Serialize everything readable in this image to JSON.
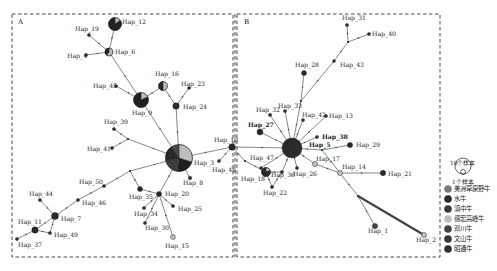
{
  "colors": {
    "american_bison": "#7a7a7a",
    "water_buffalo": "#2a2a2a",
    "dianzhong": "#3a3a3a",
    "dehong_humped": "#bdbdbd",
    "dengchuan": "#444444",
    "wenshan": "#353535",
    "zhaotong": "#303030",
    "edge": "#555555",
    "border": "#333333"
  },
  "panels": {
    "A": {
      "letter": "A"
    },
    "B": {
      "letter": "B"
    }
  },
  "legend": {
    "size_large": "10个样本",
    "size_small": "1个样本",
    "items": [
      {
        "label": "美洲草原野牛",
        "color": "#7a7a7a"
      },
      {
        "label": "水牛",
        "color": "#2a2a2a"
      },
      {
        "label": "滇中牛",
        "color": "#3a3a3a"
      },
      {
        "label": "德宏高峰牛",
        "color": "#bdbdbd"
      },
      {
        "label": "邓川牛",
        "color": "#444444"
      },
      {
        "label": "文山牛",
        "color": "#353535"
      },
      {
        "label": "昭通牛",
        "color": "#303030"
      }
    ]
  },
  "nodes": [
    {
      "id": "Hap_12",
      "label": "Hap_12",
      "x": 115,
      "y": 24,
      "r": 6.5,
      "fill": "#2b2b2b",
      "lx": 122,
      "ly": 24
    },
    {
      "id": "Hap_19",
      "label": "Hap_19",
      "x": 89,
      "y": 35,
      "r": 1.6,
      "fill": "#333",
      "lx": 75,
      "ly": 31
    },
    {
      "id": "Hap_6",
      "label": "Hap_6",
      "x": 109,
      "y": 52,
      "r": 4,
      "fill": "#bdbdbd",
      "lx": 115,
      "ly": 54
    },
    {
      "id": "Hap_4",
      "label": "Hap_4",
      "x": 86,
      "y": 55,
      "r": 1.6,
      "fill": "#333",
      "lx": 67,
      "ly": 58
    },
    {
      "id": "Hap_16",
      "label": "Hap_16",
      "x": 163,
      "y": 86,
      "r": 4.5,
      "fill": "#bdbdbd",
      "lx": 155,
      "ly": 76
    },
    {
      "id": "Hap_23",
      "label": "Hap_23",
      "x": 189,
      "y": 88,
      "r": 1.5,
      "fill": "#333",
      "lx": 181,
      "ly": 86
    },
    {
      "id": "Hap_45",
      "label": "Hap_45",
      "x": 116,
      "y": 86,
      "r": 1.6,
      "fill": "#333",
      "lx": 93,
      "ly": 88
    },
    {
      "id": "Hap_9",
      "label": "Hap_9",
      "x": 141,
      "y": 100,
      "r": 7.5,
      "fill": "#2a2a2a",
      "lx": 132,
      "ly": 115
    },
    {
      "id": "Hap_24",
      "label": "Hap_24",
      "x": 176,
      "y": 106,
      "r": 3.2,
      "fill": "#2a2a2a",
      "lx": 183,
      "ly": 109
    },
    {
      "id": "Hap_39",
      "label": "Hap_39",
      "x": 114,
      "y": 129,
      "r": 1.6,
      "fill": "#333",
      "lx": 104,
      "ly": 124
    },
    {
      "id": "Hap_41",
      "label": "Hap_41",
      "x": 112,
      "y": 148,
      "r": 1.6,
      "fill": "#333",
      "lx": 87,
      "ly": 151
    },
    {
      "id": "Hap_3",
      "label": "Hap_3",
      "x": 179,
      "y": 158,
      "r": 13.5,
      "fill": "#2a2a2a",
      "lx": 194,
      "ly": 165
    },
    {
      "id": "Hap_10",
      "label": "Hap_10",
      "x": 232,
      "y": 147,
      "r": 3.2,
      "fill": "#2a2a2a",
      "lx": 214,
      "ly": 142
    },
    {
      "id": "Hap_48",
      "label": "Hap_48",
      "x": 219,
      "y": 161,
      "r": 1.6,
      "fill": "#333",
      "lx": 212,
      "ly": 172
    },
    {
      "id": "Hap_8",
      "label": "Hap_8",
      "x": 190,
      "y": 178,
      "r": 1.8,
      "fill": "#333",
      "lx": 183,
      "ly": 185
    },
    {
      "id": "Hap_50",
      "label": "Hap_50",
      "x": 104,
      "y": 186,
      "r": 1.6,
      "fill": "#333",
      "lx": 79,
      "ly": 184
    },
    {
      "id": "Hap_35",
      "label": "Hap_35",
      "x": 140,
      "y": 189,
      "r": 2.5,
      "fill": "#2a2a2a",
      "lx": 129,
      "ly": 199
    },
    {
      "id": "Hap_20",
      "label": "Hap_20",
      "x": 159,
      "y": 194,
      "r": 2.5,
      "fill": "#2a2a2a",
      "lx": 165,
      "ly": 196
    },
    {
      "id": "Hap_44",
      "label": "Hap_44",
      "x": 40,
      "y": 200,
      "r": 1.6,
      "fill": "#333",
      "lx": 29,
      "ly": 196
    },
    {
      "id": "Hap_46",
      "label": "Hap_46",
      "x": 78,
      "y": 200,
      "r": 1.6,
      "fill": "#333",
      "lx": 82,
      "ly": 205
    },
    {
      "id": "Hap_34",
      "label": "Hap_34",
      "x": 144,
      "y": 208,
      "r": 1.6,
      "fill": "#333",
      "lx": 134,
      "ly": 216
    },
    {
      "id": "Hap_25",
      "label": "Hap_25",
      "x": 173,
      "y": 206,
      "r": 1.6,
      "fill": "#333",
      "lx": 178,
      "ly": 211
    },
    {
      "id": "Hap_7",
      "label": "Hap_7",
      "x": 55,
      "y": 216,
      "r": 3.5,
      "fill": "#2a2a2a",
      "lx": 61,
      "ly": 221
    },
    {
      "id": "Hap_30",
      "label": "Hap_30",
      "x": 145,
      "y": 223,
      "r": 1.6,
      "fill": "#333",
      "lx": 145,
      "ly": 230
    },
    {
      "id": "Hap_11",
      "label": "Hap_11",
      "x": 35,
      "y": 230,
      "r": 3.2,
      "fill": "#2a2a2a",
      "lx": 18,
      "ly": 224
    },
    {
      "id": "Hap_49",
      "label": "Hap_49",
      "x": 50,
      "y": 233,
      "r": 1.6,
      "fill": "#333",
      "lx": 54,
      "ly": 237
    },
    {
      "id": "Hap_37",
      "label": "Hap_37",
      "x": 17,
      "y": 239,
      "r": 1.6,
      "fill": "#333",
      "lx": 18,
      "ly": 247
    },
    {
      "id": "Hap_15",
      "label": "Hap_15",
      "x": 173,
      "y": 237,
      "r": 2.5,
      "fill": "#bdbdbd",
      "lx": 165,
      "ly": 248
    },
    {
      "id": "Hap_31",
      "label": "Hap_31",
      "x": 347,
      "y": 25,
      "r": 1.6,
      "fill": "#333",
      "lx": 342,
      "ly": 20
    },
    {
      "id": "Hap_40",
      "label": "Hap_40",
      "x": 369,
      "y": 34,
      "r": 1.6,
      "fill": "#333",
      "lx": 372,
      "ly": 36
    },
    {
      "id": "Hap_43",
      "label": "Hap_43",
      "x": 334,
      "y": 61,
      "r": 1.5,
      "fill": "#333",
      "lx": 340,
      "ly": 67
    },
    {
      "id": "Hap_28",
      "label": "Hap_28",
      "x": 304,
      "y": 73,
      "r": 2.5,
      "fill": "#2a2a2a",
      "lx": 295,
      "ly": 67
    },
    {
      "id": "Hap_32",
      "label": "Hap_32",
      "x": 270,
      "y": 115,
      "r": 1.6,
      "fill": "#333",
      "lx": 256,
      "ly": 112
    },
    {
      "id": "Hap_33",
      "label": "Hap_33",
      "x": 285,
      "y": 111,
      "r": 1.6,
      "fill": "#333",
      "lx": 278,
      "ly": 108
    },
    {
      "id": "Hap_42",
      "label": "Hap_42",
      "x": 303,
      "y": 120,
      "r": 1.6,
      "fill": "#333",
      "lx": 302,
      "ly": 117
    },
    {
      "id": "Hap_13",
      "label": "Hap_13",
      "x": 326,
      "y": 116,
      "r": 1.6,
      "fill": "#333",
      "lx": 329,
      "ly": 118
    },
    {
      "id": "Hap_27",
      "label": "Hap_27",
      "x": 260,
      "y": 132,
      "r": 3,
      "fill": "#2a2a2a",
      "lx": 248,
      "ly": 127,
      "bold": true
    },
    {
      "id": "Hap_38",
      "label": "Hap_38",
      "x": 317,
      "y": 137,
      "r": 1.6,
      "fill": "#333",
      "lx": 322,
      "ly": 139,
      "bold": true
    },
    {
      "id": "Hap_5",
      "label": "Hap_5",
      "x": 292,
      "y": 148,
      "r": 10,
      "fill": "#2a2a2a",
      "lx": 309,
      "ly": 147,
      "bold": true
    },
    {
      "id": "Hap_29",
      "label": "Hap_29",
      "x": 350,
      "y": 145,
      "r": 2.6,
      "fill": "#2a2a2a",
      "lx": 356,
      "ly": 147
    },
    {
      "id": "Hap_17",
      "label": "Hap_17",
      "x": 315,
      "y": 164,
      "r": 2.6,
      "fill": "#bdbdbd",
      "lx": 316,
      "ly": 161
    },
    {
      "id": "Hap_47",
      "label": "Hap_47",
      "x": 261,
      "y": 168,
      "r": 1.5,
      "fill": "#333",
      "lx": 250,
      "ly": 160
    },
    {
      "id": "Hap_14",
      "label": "Hap_14",
      "x": 340,
      "y": 173,
      "r": 2.6,
      "fill": "#bdbdbd",
      "lx": 342,
      "ly": 169
    },
    {
      "id": "Hap_21",
      "label": "Hap_21",
      "x": 383,
      "y": 173,
      "r": 2.7,
      "fill": "#2a2a2a",
      "lx": 388,
      "ly": 176
    },
    {
      "id": "Hap_26",
      "label": "Hap_26",
      "x": 297,
      "y": 168,
      "r": 1.6,
      "fill": "#333",
      "lx": 293,
      "ly": 176
    },
    {
      "id": "Hap_36",
      "label": "Hap_36",
      "x": 282,
      "y": 172,
      "r": 1.6,
      "fill": "#333",
      "lx": 271,
      "ly": 177
    },
    {
      "id": "Hap_18",
      "label": "Hap_18",
      "x": 266,
      "y": 172,
      "r": 4.5,
      "fill": "#2a2a2a",
      "lx": 241,
      "ly": 181
    },
    {
      "id": "Hap_22",
      "label": "Hap_22",
      "x": 272,
      "y": 187,
      "r": 1.6,
      "fill": "#333",
      "lx": 263,
      "ly": 195
    },
    {
      "id": "Hap_1",
      "label": "Hap_1",
      "x": 375,
      "y": 226,
      "r": 2.6,
      "fill": "#444",
      "lx": 368,
      "ly": 233
    },
    {
      "id": "Hap_2",
      "label": "Hap_2",
      "x": 424,
      "y": 235,
      "r": 2.6,
      "fill": "#bdbdbd",
      "lx": 416,
      "ly": 242
    }
  ],
  "pies": {
    "Hap_3": [
      {
        "frac": 0.3,
        "color": "#bdbdbd"
      },
      {
        "frac": 0.22,
        "color": "#1e1e1e"
      },
      {
        "frac": 0.2,
        "color": "#3d3d3d"
      },
      {
        "frac": 0.18,
        "color": "#2a2a2a"
      },
      {
        "frac": 0.1,
        "color": "#4a4a4a"
      }
    ],
    "Hap_9": [
      {
        "frac": 0.18,
        "color": "#bdbdbd"
      },
      {
        "frac": 0.82,
        "color": "#222222"
      }
    ],
    "Hap_6": [
      {
        "frac": 0.6,
        "color": "#bdbdbd"
      },
      {
        "frac": 0.4,
        "color": "#222222"
      }
    ],
    "Hap_16": [
      {
        "frac": 0.5,
        "color": "#bdbdbd"
      },
      {
        "frac": 0.5,
        "color": "#2a2a2a"
      }
    ],
    "Hap_12": [
      {
        "frac": 0.15,
        "color": "#bdbdbd"
      },
      {
        "frac": 0.85,
        "color": "#222222"
      }
    ],
    "Hap_18": [
      {
        "frac": 0.2,
        "color": "#bdbdbd"
      },
      {
        "frac": 0.8,
        "color": "#2a2a2a"
      }
    ]
  },
  "edges": [
    [
      "Hap_12",
      "Hap_6"
    ],
    [
      "Hap_19",
      "Hap_6"
    ],
    [
      "Hap_4",
      "Hap_6"
    ],
    [
      "Hap_6",
      "Hap_9"
    ],
    [
      "Hap_45",
      "Hap_9"
    ],
    [
      "Hap_9",
      "Hap_16"
    ],
    [
      "Hap_16",
      "Hap_24"
    ],
    [
      "Hap_23",
      "Hap_24"
    ],
    [
      "Hap_9",
      "Hap_3"
    ],
    [
      "Hap_24",
      "Hap_3"
    ],
    [
      "Hap_39",
      "J_A1"
    ],
    [
      "Hap_41",
      "J_A1"
    ],
    [
      "J_A1",
      "Hap_3"
    ],
    [
      "Hap_3",
      "Hap_10"
    ],
    [
      "Hap_10",
      "Hap_48"
    ],
    [
      "Hap_3",
      "Hap_8"
    ],
    [
      "Hap_3",
      "J_A2"
    ],
    [
      "J_A2",
      "Hap_50"
    ],
    [
      "Hap_50",
      "Hap_46"
    ],
    [
      "Hap_46",
      "Hap_7"
    ],
    [
      "Hap_44",
      "Hap_7"
    ],
    [
      "Hap_7",
      "Hap_11"
    ],
    [
      "Hap_7",
      "Hap_49"
    ],
    [
      "Hap_11",
      "Hap_49"
    ],
    [
      "Hap_11",
      "Hap_37"
    ],
    [
      "J_A2",
      "Hap_35"
    ],
    [
      "Hap_35",
      "Hap_20"
    ],
    [
      "Hap_3",
      "Hap_20"
    ],
    [
      "Hap_20",
      "Hap_34"
    ],
    [
      "Hap_20",
      "Hap_30"
    ],
    [
      "Hap_20",
      "Hap_25"
    ],
    [
      "Hap_20",
      "Hap_15"
    ],
    [
      "Hap_10",
      "Hap_5"
    ],
    [
      "Hap_10",
      "J_B0"
    ],
    [
      "J_B0",
      "Hap_18"
    ],
    [
      "Hap_31",
      "J_B1"
    ],
    [
      "Hap_40",
      "J_B1"
    ],
    [
      "J_B1",
      "Hap_43"
    ],
    [
      "Hap_43",
      "J_B2"
    ],
    [
      "Hap_28",
      "J_B2"
    ],
    [
      "J_B2",
      "Hap_5"
    ],
    [
      "Hap_32",
      "Hap_5"
    ],
    [
      "Hap_33",
      "Hap_5"
    ],
    [
      "Hap_42",
      "Hap_5"
    ],
    [
      "Hap_13",
      "Hap_5"
    ],
    [
      "Hap_27",
      "Hap_5"
    ],
    [
      "Hap_38",
      "Hap_5"
    ],
    [
      "Hap_5",
      "J_B3"
    ],
    [
      "J_B3",
      "Hap_29"
    ],
    [
      "J_B3",
      "Hap_14"
    ],
    [
      "Hap_5",
      "Hap_17"
    ],
    [
      "Hap_17",
      "Hap_14"
    ],
    [
      "Hap_14",
      "Hap_21"
    ],
    [
      "Hap_5",
      "Hap_26"
    ],
    [
      "Hap_5",
      "Hap_36"
    ],
    [
      "Hap_5",
      "Hap_47"
    ],
    [
      "Hap_47",
      "Hap_18"
    ],
    [
      "Hap_18",
      "Hap_22"
    ],
    [
      "Hap_36",
      "Hap_22"
    ],
    [
      "Hap_36",
      "Hap_18"
    ],
    [
      "Hap_14",
      "J_B4"
    ],
    [
      "J_B4",
      "Hap_1"
    ]
  ],
  "thick_edges": [
    [
      "J_B4",
      "Hap_2"
    ]
  ],
  "junctions": {
    "J_A1": {
      "x": 128,
      "y": 139
    },
    "J_A2": {
      "x": 130,
      "y": 171
    },
    "J_B0": {
      "x": 245,
      "y": 161
    },
    "J_B1": {
      "x": 348,
      "y": 42
    },
    "J_B2": {
      "x": 301,
      "y": 101
    },
    "J_B3": {
      "x": 322,
      "y": 150
    },
    "J_B4": {
      "x": 358,
      "y": 196
    }
  }
}
